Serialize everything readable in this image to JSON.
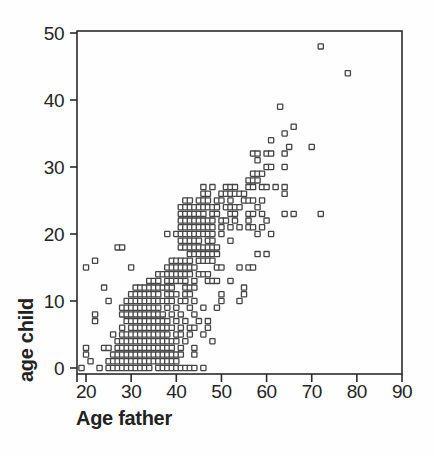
{
  "figure": {
    "background": "#fefefe",
    "ink_color": "#2b2b2b",
    "marker": {
      "shape": "open-square",
      "size_px": 5.2,
      "stroke": "#454545",
      "fill": "#ffffff"
    }
  },
  "chart_data": {
    "type": "scatter",
    "title": "",
    "xlabel": "Age father",
    "ylabel": "age child",
    "xlim": [
      18,
      90
    ],
    "ylim": [
      0,
      50
    ],
    "x_ticks": [
      20,
      30,
      40,
      50,
      60,
      70,
      80,
      90
    ],
    "y_ticks": [
      0,
      10,
      20,
      30,
      40,
      50
    ],
    "grid": false,
    "legend": null,
    "plot_area": {
      "left": 77,
      "top": 31,
      "right": 402,
      "bottom": 374
    },
    "points": [
      [
        19,
        0
      ],
      [
        23,
        0
      ],
      [
        25,
        0
      ],
      [
        26,
        0
      ],
      [
        27,
        0
      ],
      [
        28,
        0
      ],
      [
        29,
        0
      ],
      [
        30,
        0
      ],
      [
        31,
        0
      ],
      [
        32,
        0
      ],
      [
        33,
        0
      ],
      [
        34,
        0
      ],
      [
        36,
        0
      ],
      [
        37,
        0
      ],
      [
        38,
        0
      ],
      [
        39,
        0
      ],
      [
        40,
        0
      ],
      [
        41,
        0
      ],
      [
        42,
        0
      ],
      [
        43,
        0
      ],
      [
        44,
        0
      ],
      [
        46,
        0
      ],
      [
        21,
        1
      ],
      [
        25,
        1
      ],
      [
        26,
        1
      ],
      [
        27,
        1
      ],
      [
        28,
        1
      ],
      [
        29,
        1
      ],
      [
        30,
        1
      ],
      [
        31,
        1
      ],
      [
        32,
        1
      ],
      [
        33,
        1
      ],
      [
        34,
        1
      ],
      [
        35,
        1
      ],
      [
        36,
        1
      ],
      [
        37,
        1
      ],
      [
        38,
        1
      ],
      [
        39,
        1
      ],
      [
        40,
        1
      ],
      [
        20,
        2
      ],
      [
        26,
        2
      ],
      [
        27,
        2
      ],
      [
        28,
        2
      ],
      [
        29,
        2
      ],
      [
        30,
        2
      ],
      [
        31,
        2
      ],
      [
        32,
        2
      ],
      [
        33,
        2
      ],
      [
        34,
        2
      ],
      [
        35,
        2
      ],
      [
        36,
        2
      ],
      [
        37,
        2
      ],
      [
        38,
        2
      ],
      [
        39,
        2
      ],
      [
        40,
        2
      ],
      [
        41,
        2
      ],
      [
        44,
        2
      ],
      [
        20,
        3
      ],
      [
        24,
        3
      ],
      [
        25,
        3
      ],
      [
        27,
        3
      ],
      [
        28,
        3
      ],
      [
        29,
        3
      ],
      [
        30,
        3
      ],
      [
        31,
        3
      ],
      [
        32,
        3
      ],
      [
        33,
        3
      ],
      [
        34,
        3
      ],
      [
        35,
        3
      ],
      [
        36,
        3
      ],
      [
        37,
        3
      ],
      [
        38,
        3
      ],
      [
        39,
        3
      ],
      [
        41,
        3
      ],
      [
        44,
        3
      ],
      [
        27,
        4
      ],
      [
        28,
        4
      ],
      [
        29,
        4
      ],
      [
        30,
        4
      ],
      [
        31,
        4
      ],
      [
        32,
        4
      ],
      [
        33,
        4
      ],
      [
        34,
        4
      ],
      [
        35,
        4
      ],
      [
        36,
        4
      ],
      [
        37,
        4
      ],
      [
        38,
        4
      ],
      [
        39,
        4
      ],
      [
        40,
        4
      ],
      [
        42,
        4
      ],
      [
        48,
        4
      ],
      [
        26,
        5
      ],
      [
        28,
        5
      ],
      [
        29,
        5
      ],
      [
        30,
        5
      ],
      [
        31,
        5
      ],
      [
        32,
        5
      ],
      [
        33,
        5
      ],
      [
        34,
        5
      ],
      [
        35,
        5
      ],
      [
        36,
        5
      ],
      [
        37,
        5
      ],
      [
        38,
        5
      ],
      [
        40,
        5
      ],
      [
        41,
        5
      ],
      [
        43,
        5
      ],
      [
        46,
        5
      ],
      [
        28,
        6
      ],
      [
        30,
        6
      ],
      [
        31,
        6
      ],
      [
        32,
        6
      ],
      [
        33,
        6
      ],
      [
        34,
        6
      ],
      [
        35,
        6
      ],
      [
        36,
        6
      ],
      [
        37,
        6
      ],
      [
        38,
        6
      ],
      [
        39,
        6
      ],
      [
        41,
        6
      ],
      [
        43,
        6
      ],
      [
        44,
        6
      ],
      [
        47,
        6
      ],
      [
        22,
        7
      ],
      [
        29,
        7
      ],
      [
        30,
        7
      ],
      [
        31,
        7
      ],
      [
        32,
        7
      ],
      [
        33,
        7
      ],
      [
        34,
        7
      ],
      [
        35,
        7
      ],
      [
        36,
        7
      ],
      [
        37,
        7
      ],
      [
        38,
        7
      ],
      [
        40,
        7
      ],
      [
        42,
        7
      ],
      [
        45,
        7
      ],
      [
        47,
        7
      ],
      [
        22,
        8
      ],
      [
        28,
        8
      ],
      [
        29,
        8
      ],
      [
        30,
        8
      ],
      [
        31,
        8
      ],
      [
        32,
        8
      ],
      [
        33,
        8
      ],
      [
        34,
        8
      ],
      [
        35,
        8
      ],
      [
        36,
        8
      ],
      [
        37,
        8
      ],
      [
        39,
        8
      ],
      [
        41,
        8
      ],
      [
        44,
        8
      ],
      [
        28,
        9
      ],
      [
        29,
        9
      ],
      [
        30,
        9
      ],
      [
        31,
        9
      ],
      [
        32,
        9
      ],
      [
        33,
        9
      ],
      [
        34,
        9
      ],
      [
        35,
        9
      ],
      [
        36,
        9
      ],
      [
        38,
        9
      ],
      [
        40,
        9
      ],
      [
        43,
        9
      ],
      [
        46,
        9
      ],
      [
        49,
        9
      ],
      [
        25,
        10
      ],
      [
        29,
        10
      ],
      [
        30,
        10
      ],
      [
        31,
        10
      ],
      [
        32,
        10
      ],
      [
        33,
        10
      ],
      [
        34,
        10
      ],
      [
        35,
        10
      ],
      [
        36,
        10
      ],
      [
        37,
        10
      ],
      [
        38,
        10
      ],
      [
        39,
        10
      ],
      [
        41,
        10
      ],
      [
        42,
        10
      ],
      [
        44,
        10
      ],
      [
        50,
        10
      ],
      [
        54,
        10
      ],
      [
        30,
        11
      ],
      [
        31,
        11
      ],
      [
        32,
        11
      ],
      [
        33,
        11
      ],
      [
        34,
        11
      ],
      [
        35,
        11
      ],
      [
        36,
        11
      ],
      [
        38,
        11
      ],
      [
        39,
        11
      ],
      [
        40,
        11
      ],
      [
        42,
        11
      ],
      [
        43,
        11
      ],
      [
        50,
        11
      ],
      [
        55,
        11
      ],
      [
        24,
        12
      ],
      [
        31,
        12
      ],
      [
        32,
        12
      ],
      [
        33,
        12
      ],
      [
        34,
        12
      ],
      [
        35,
        12
      ],
      [
        36,
        12
      ],
      [
        37,
        12
      ],
      [
        38,
        12
      ],
      [
        39,
        12
      ],
      [
        42,
        12
      ],
      [
        43,
        12
      ],
      [
        44,
        12
      ],
      [
        55,
        12
      ],
      [
        34,
        13
      ],
      [
        35,
        13
      ],
      [
        36,
        13
      ],
      [
        38,
        13
      ],
      [
        39,
        13
      ],
      [
        40,
        13
      ],
      [
        41,
        13
      ],
      [
        42,
        13
      ],
      [
        44,
        13
      ],
      [
        47,
        13
      ],
      [
        48,
        13
      ],
      [
        49,
        13
      ],
      [
        52,
        13
      ],
      [
        36,
        14
      ],
      [
        37,
        14
      ],
      [
        38,
        14
      ],
      [
        39,
        14
      ],
      [
        40,
        14
      ],
      [
        41,
        14
      ],
      [
        42,
        14
      ],
      [
        43,
        14
      ],
      [
        45,
        14
      ],
      [
        46,
        14
      ],
      [
        47,
        14
      ],
      [
        20,
        15
      ],
      [
        30,
        15
      ],
      [
        38,
        15
      ],
      [
        39,
        15
      ],
      [
        40,
        15
      ],
      [
        41,
        15
      ],
      [
        42,
        15
      ],
      [
        43,
        15
      ],
      [
        44,
        15
      ],
      [
        49,
        15
      ],
      [
        50,
        15
      ],
      [
        54,
        15
      ],
      [
        56,
        15
      ],
      [
        57,
        15
      ],
      [
        22,
        16
      ],
      [
        39,
        16
      ],
      [
        40,
        16
      ],
      [
        41,
        16
      ],
      [
        42,
        16
      ],
      [
        43,
        16
      ],
      [
        45,
        16
      ],
      [
        46,
        16
      ],
      [
        47,
        16
      ],
      [
        48,
        16
      ],
      [
        43,
        17
      ],
      [
        44,
        17
      ],
      [
        45,
        17
      ],
      [
        46,
        17
      ],
      [
        47,
        17
      ],
      [
        48,
        17
      ],
      [
        49,
        17
      ],
      [
        58,
        17
      ],
      [
        60,
        17
      ],
      [
        27,
        18
      ],
      [
        28,
        18
      ],
      [
        41,
        18
      ],
      [
        42,
        18
      ],
      [
        43,
        18
      ],
      [
        44,
        18
      ],
      [
        45,
        18
      ],
      [
        46,
        18
      ],
      [
        47,
        18
      ],
      [
        48,
        18
      ],
      [
        49,
        18
      ],
      [
        41,
        19
      ],
      [
        42,
        19
      ],
      [
        43,
        19
      ],
      [
        44,
        19
      ],
      [
        45,
        19
      ],
      [
        47,
        19
      ],
      [
        48,
        19
      ],
      [
        52,
        19
      ],
      [
        38,
        20
      ],
      [
        40,
        20
      ],
      [
        41,
        20
      ],
      [
        42,
        20
      ],
      [
        43,
        20
      ],
      [
        44,
        20
      ],
      [
        45,
        20
      ],
      [
        46,
        20
      ],
      [
        47,
        20
      ],
      [
        48,
        20
      ],
      [
        50,
        20
      ],
      [
        58,
        20
      ],
      [
        61,
        20
      ],
      [
        41,
        21
      ],
      [
        42,
        21
      ],
      [
        43,
        21
      ],
      [
        44,
        21
      ],
      [
        45,
        21
      ],
      [
        46,
        21
      ],
      [
        47,
        21
      ],
      [
        48,
        21
      ],
      [
        50,
        21
      ],
      [
        52,
        21
      ],
      [
        54,
        21
      ],
      [
        56,
        21
      ],
      [
        57,
        21
      ],
      [
        59,
        21
      ],
      [
        41,
        22
      ],
      [
        42,
        22
      ],
      [
        43,
        22
      ],
      [
        44,
        22
      ],
      [
        45,
        22
      ],
      [
        46,
        22
      ],
      [
        47,
        22
      ],
      [
        48,
        22
      ],
      [
        50,
        22
      ],
      [
        51,
        22
      ],
      [
        53,
        22
      ],
      [
        56,
        22
      ],
      [
        60,
        22
      ],
      [
        41,
        23
      ],
      [
        42,
        23
      ],
      [
        43,
        23
      ],
      [
        44,
        23
      ],
      [
        45,
        23
      ],
      [
        46,
        23
      ],
      [
        48,
        23
      ],
      [
        49,
        23
      ],
      [
        52,
        23
      ],
      [
        53,
        23
      ],
      [
        56,
        23
      ],
      [
        57,
        23
      ],
      [
        59,
        23
      ],
      [
        64,
        23
      ],
      [
        66,
        23
      ],
      [
        72,
        23
      ],
      [
        41,
        24
      ],
      [
        42,
        24
      ],
      [
        43,
        24
      ],
      [
        44,
        24
      ],
      [
        45,
        24
      ],
      [
        46,
        24
      ],
      [
        47,
        24
      ],
      [
        48,
        24
      ],
      [
        49,
        24
      ],
      [
        51,
        24
      ],
      [
        52,
        24
      ],
      [
        53,
        24
      ],
      [
        54,
        24
      ],
      [
        58,
        24
      ],
      [
        42,
        25
      ],
      [
        43,
        25
      ],
      [
        45,
        25
      ],
      [
        46,
        25
      ],
      [
        47,
        25
      ],
      [
        49,
        25
      ],
      [
        50,
        25
      ],
      [
        52,
        25
      ],
      [
        55,
        25
      ],
      [
        56,
        25
      ],
      [
        57,
        25
      ],
      [
        59,
        25
      ],
      [
        46,
        26
      ],
      [
        47,
        26
      ],
      [
        50,
        26
      ],
      [
        51,
        26
      ],
      [
        52,
        26
      ],
      [
        53,
        26
      ],
      [
        54,
        26
      ],
      [
        55,
        26
      ],
      [
        64,
        26
      ],
      [
        46,
        27
      ],
      [
        48,
        27
      ],
      [
        51,
        27
      ],
      [
        52,
        27
      ],
      [
        53,
        27
      ],
      [
        56,
        27
      ],
      [
        57,
        27
      ],
      [
        59,
        27
      ],
      [
        60,
        27
      ],
      [
        62,
        27
      ],
      [
        64,
        27
      ],
      [
        56,
        28
      ],
      [
        57,
        28
      ],
      [
        58,
        28
      ],
      [
        57,
        29
      ],
      [
        58,
        29
      ],
      [
        59,
        29
      ],
      [
        60,
        30
      ],
      [
        61,
        30
      ],
      [
        64,
        30
      ],
      [
        58,
        31
      ],
      [
        57,
        32
      ],
      [
        58,
        32
      ],
      [
        60,
        32
      ],
      [
        61,
        32
      ],
      [
        64,
        32
      ],
      [
        65,
        33
      ],
      [
        70,
        33
      ],
      [
        61,
        34
      ],
      [
        64,
        35
      ],
      [
        66,
        36
      ],
      [
        63,
        39
      ],
      [
        78,
        44
      ],
      [
        72,
        48
      ]
    ]
  }
}
